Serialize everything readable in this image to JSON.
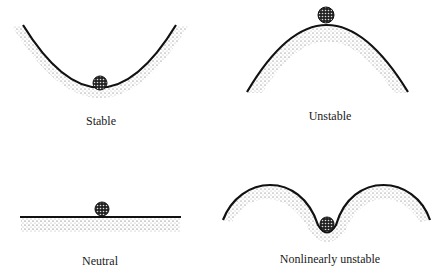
{
  "figure": {
    "panels": [
      {
        "id": "stable",
        "label": "Stable"
      },
      {
        "id": "unstable",
        "label": "Unstable"
      },
      {
        "id": "neutral",
        "label": "Neutral"
      },
      {
        "id": "nonlinear",
        "label": "Nonlinearly unstable"
      }
    ],
    "colors": {
      "line": "#111111",
      "stipple": "#555555",
      "background": "#ffffff"
    }
  }
}
